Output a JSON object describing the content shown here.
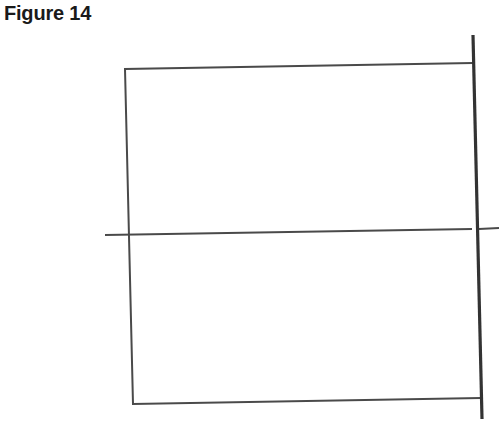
{
  "figure": {
    "title": "Figure 14",
    "stroke_color": "#4a4a4a",
    "thick_stroke_color": "#333333",
    "rectangle": {
      "top_left": [
        125,
        69
      ],
      "top_right": [
        473,
        63
      ],
      "bottom_right": [
        481,
        398
      ],
      "bottom_left": [
        133,
        404
      ]
    },
    "horizontal_line": {
      "start": [
        105,
        235
      ],
      "end": [
        499,
        228
      ]
    },
    "vertical_line": {
      "start": [
        473,
        35
      ],
      "end": [
        482,
        419
      ]
    }
  }
}
